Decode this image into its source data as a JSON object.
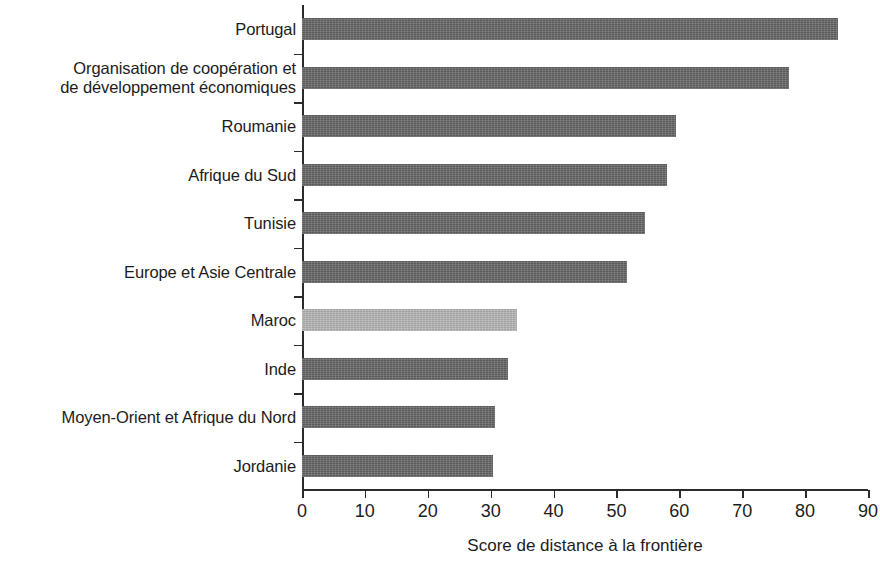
{
  "chart_data": {
    "type": "bar",
    "orientation": "horizontal",
    "title": "",
    "xlabel": "Score de distance à la frontière",
    "ylabel": "",
    "xlim": [
      0,
      90
    ],
    "xticks": [
      0,
      10,
      20,
      30,
      40,
      50,
      60,
      70,
      80,
      90
    ],
    "xtick_labels": [
      "0",
      "10",
      "20",
      "30",
      "40",
      "50",
      "60",
      "70",
      "80",
      "90"
    ],
    "grid": false,
    "legend": null,
    "categories": [
      "Portugal",
      "Organisation de coopération et\nde développement économiques",
      "Roumanie",
      "Afrique du Sud",
      "Tunisie",
      "Europe et Asie Centrale",
      "Maroc",
      "Inde",
      "Moyen-Orient et Afrique du Nord",
      "Jordanie"
    ],
    "values": [
      85.3,
      77.4,
      59.4,
      58.0,
      54.6,
      51.6,
      34.2,
      32.8,
      30.7,
      30.4
    ],
    "highlight_index": 6,
    "colors": {
      "bar": "#656565",
      "bar_highlight": "#b5b5b5",
      "axis": "#2b2b2b",
      "text": "#1c1c1c",
      "background": "#ffffff"
    }
  }
}
